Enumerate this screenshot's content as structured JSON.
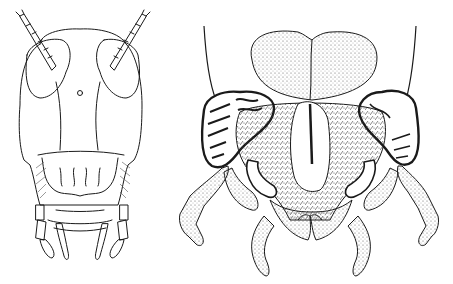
{
  "figure": {
    "panels": [
      {
        "id": "left",
        "subject": "insect-head-frontal-view",
        "style": "line-drawing"
      },
      {
        "id": "right",
        "subject": "insect-mouthparts-ventral-view",
        "style": "stippled-line-drawing"
      }
    ],
    "colors": {
      "ink": "#1a1a1a",
      "background": "#ffffff",
      "hatch": "#555555"
    }
  }
}
